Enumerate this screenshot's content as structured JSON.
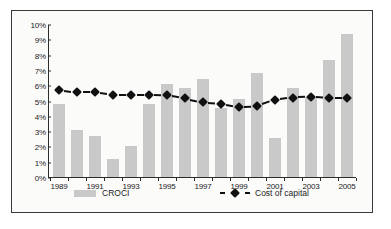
{
  "chart_data": {
    "type": "bar",
    "title": "",
    "subtitle": "",
    "xlabel": "",
    "ylabel": "",
    "ylim": [
      0,
      10
    ],
    "ytick_labels": [
      "0%",
      "1%",
      "2%",
      "3%",
      "4%",
      "5%",
      "6%",
      "7%",
      "8%",
      "9%",
      "10%"
    ],
    "ytick_values": [
      0,
      1,
      2,
      3,
      4,
      5,
      6,
      7,
      8,
      9,
      10
    ],
    "grid": false,
    "legend_position": "bottom",
    "categories": [
      1989,
      1990,
      1991,
      1992,
      1993,
      1994,
      1995,
      1996,
      1997,
      1998,
      1999,
      2000,
      2001,
      2002,
      2003,
      2004,
      2005
    ],
    "xtick_labels": [
      "1989",
      "1991",
      "1993",
      "1995",
      "1997",
      "1999",
      "2001",
      "2003",
      "2005"
    ],
    "xtick_categories": [
      1989,
      1991,
      1993,
      1995,
      1997,
      1999,
      2001,
      2003,
      2005
    ],
    "series": [
      {
        "name": "CROCI",
        "type": "bar",
        "color": "#c9c9c9",
        "values": [
          4.75,
          3.1,
          2.7,
          1.15,
          2.05,
          4.75,
          6.1,
          5.85,
          6.4,
          4.5,
          5.1,
          6.8,
          2.55,
          5.8,
          5.25,
          7.65,
          9.35
        ]
      },
      {
        "name": "Cost of capital",
        "type": "line",
        "color": "#111111",
        "line_style": "dashed",
        "marker": "diamond",
        "values": [
          5.75,
          5.6,
          5.6,
          5.45,
          5.45,
          5.45,
          5.4,
          5.2,
          4.95,
          4.85,
          4.65,
          4.7,
          5.1,
          5.25,
          5.3,
          5.2,
          5.2
        ]
      }
    ]
  },
  "legend": {
    "croci_label": "CROCI",
    "cost_of_capital_label": "Cost of capital"
  }
}
